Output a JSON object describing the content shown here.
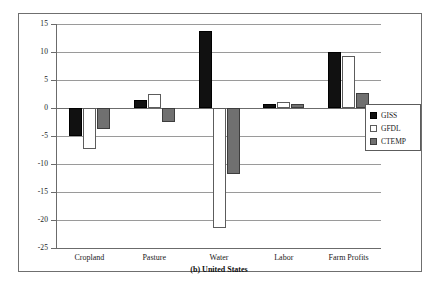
{
  "chart_data": {
    "type": "bar",
    "title": "(b) United States",
    "subtitle": "(b) United States",
    "xlabel": "",
    "ylabel": "",
    "ylim": [
      -25,
      15
    ],
    "yticks": [
      15,
      10,
      5,
      0,
      -5,
      -10,
      -15,
      -20,
      -25
    ],
    "ytick_labels": [
      "15",
      "10",
      "5",
      "0",
      "-5",
      "-10",
      "-15",
      "-20",
      "-25"
    ],
    "grid": true,
    "legend_position": "right",
    "categories": [
      "Cropland",
      "Pasture",
      "Water",
      "Labor",
      "Farm Profits"
    ],
    "series": [
      {
        "name": "GISS",
        "color": "#111111",
        "values": [
          -5.0,
          1.5,
          13.7,
          0.8,
          10.0
        ]
      },
      {
        "name": "GFDL",
        "color": "#ffffff",
        "values": [
          -7.3,
          2.5,
          -21.5,
          1.0,
          9.2
        ]
      },
      {
        "name": "CTEMP",
        "color": "#707070",
        "values": [
          -3.7,
          -2.5,
          -11.8,
          0.7,
          2.6
        ]
      }
    ]
  },
  "legend": {
    "items": [
      {
        "label": "GISS",
        "swatch": "black-square-icon"
      },
      {
        "label": "GFDL",
        "swatch": "white-square-icon"
      },
      {
        "label": "CTEMP",
        "swatch": "gray-square-icon"
      }
    ]
  }
}
